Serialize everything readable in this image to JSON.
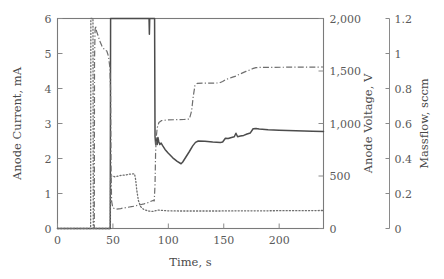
{
  "chart_data": {
    "type": "line",
    "title": "",
    "xlabel": "Time, s",
    "xlim": [
      0,
      240
    ],
    "xticks": [
      0,
      50,
      100,
      150,
      200
    ],
    "xtick_labels": [
      "0",
      "50",
      "100",
      "150",
      "200"
    ],
    "grid": false,
    "legend": "none",
    "axes": [
      {
        "id": "left",
        "label": "Anode Current, mA",
        "lim": [
          0,
          6
        ],
        "ticks": [
          0,
          1,
          2,
          3,
          4,
          5,
          6
        ],
        "tick_labels": [
          "0",
          "1",
          "2",
          "3",
          "4",
          "5",
          "6"
        ],
        "position": "left"
      },
      {
        "id": "right1",
        "label": "Anode Voltage, V",
        "lim": [
          0,
          2000
        ],
        "ticks": [
          0,
          500,
          1000,
          1500,
          2000
        ],
        "tick_labels": [
          "0",
          "500",
          "1,000",
          "1,500",
          "2,000"
        ],
        "position": "right-inner"
      },
      {
        "id": "right2",
        "label": "Massflow, sccm",
        "lim": [
          0,
          1.2
        ],
        "ticks": [
          0,
          0.2,
          0.4,
          0.6,
          0.8,
          1,
          1.2
        ],
        "tick_labels": [
          "0",
          "0.2",
          "0.4",
          "0.6",
          "0.8",
          "1",
          "1.2"
        ],
        "position": "right-outer"
      }
    ],
    "series": [
      {
        "name": "Anode Current",
        "axis": "left",
        "style": "solid",
        "color": "#4c4c4c",
        "points": [
          [
            0,
            0
          ],
          [
            47.6,
            0
          ],
          [
            47.9,
            6.0
          ],
          [
            82.6,
            6.0
          ],
          [
            82.9,
            5.55
          ],
          [
            83.2,
            6.0
          ],
          [
            87.6,
            6.0
          ],
          [
            88.0,
            2.62
          ],
          [
            88.6,
            2.4
          ],
          [
            89.3,
            2.58
          ],
          [
            90.0,
            2.4
          ],
          [
            90.6,
            2.6
          ],
          [
            91.4,
            2.48
          ],
          [
            92.3,
            2.4
          ],
          [
            93.5,
            2.44
          ],
          [
            95.0,
            2.36
          ],
          [
            97.0,
            2.26
          ],
          [
            100.0,
            2.15
          ],
          [
            104.0,
            2.02
          ],
          [
            108.0,
            1.92
          ],
          [
            111.5,
            1.85
          ],
          [
            113.0,
            1.9
          ],
          [
            116.0,
            2.05
          ],
          [
            119.0,
            2.2
          ],
          [
            122.0,
            2.36
          ],
          [
            124.5,
            2.46
          ],
          [
            127.0,
            2.5
          ],
          [
            133.0,
            2.49
          ],
          [
            140.0,
            2.47
          ],
          [
            147.0,
            2.46
          ],
          [
            149.0,
            2.47
          ],
          [
            151.5,
            2.58
          ],
          [
            154.0,
            2.57
          ],
          [
            157.0,
            2.6
          ],
          [
            159.5,
            2.62
          ],
          [
            161.0,
            2.72
          ],
          [
            162.5,
            2.62
          ],
          [
            165.0,
            2.64
          ],
          [
            168.0,
            2.66
          ],
          [
            171.0,
            2.7
          ],
          [
            174.0,
            2.73
          ],
          [
            176.5,
            2.85
          ],
          [
            179.0,
            2.86
          ],
          [
            182.0,
            2.84
          ],
          [
            190.0,
            2.82
          ],
          [
            200.0,
            2.81
          ],
          [
            215.0,
            2.79
          ],
          [
            230.0,
            2.78
          ],
          [
            240.0,
            2.77
          ]
        ]
      },
      {
        "name": "Anode Voltage",
        "axis": "right1",
        "style": "dash-dot",
        "color": "#6e6e6e",
        "points": [
          [
            0,
            0
          ],
          [
            33.2,
            0
          ],
          [
            33.4,
            1600
          ],
          [
            33.9,
            1890
          ],
          [
            34.4,
            1930
          ],
          [
            35.2,
            1880
          ],
          [
            36.5,
            1840
          ],
          [
            38.0,
            1790
          ],
          [
            40.0,
            1740
          ],
          [
            42.5,
            1700
          ],
          [
            44.5,
            1690
          ],
          [
            46.0,
            1640
          ],
          [
            47.2,
            1540
          ],
          [
            47.9,
            1330
          ],
          [
            48.3,
            600
          ],
          [
            48.8,
            260
          ],
          [
            50.0,
            195
          ],
          [
            53.0,
            185
          ],
          [
            57.0,
            190
          ],
          [
            62.0,
            200
          ],
          [
            68.0,
            210
          ],
          [
            73.0,
            222
          ],
          [
            78.0,
            234
          ],
          [
            82.0,
            248
          ],
          [
            85.0,
            262
          ],
          [
            86.5,
            268
          ],
          [
            87.3,
            262
          ],
          [
            88.0,
            420
          ],
          [
            88.5,
            720
          ],
          [
            89.2,
            880
          ],
          [
            90.0,
            960
          ],
          [
            91.5,
            1010
          ],
          [
            94.0,
            1028
          ],
          [
            99.0,
            1034
          ],
          [
            106.0,
            1036
          ],
          [
            114.0,
            1038
          ],
          [
            119.0,
            1042
          ],
          [
            121.0,
            1120
          ],
          [
            122.5,
            1260
          ],
          [
            124.0,
            1360
          ],
          [
            126.0,
            1382
          ],
          [
            132.0,
            1384
          ],
          [
            140.0,
            1385
          ],
          [
            146.0,
            1386
          ],
          [
            149.0,
            1400
          ],
          [
            152.0,
            1420
          ],
          [
            155.0,
            1430
          ],
          [
            158.0,
            1442
          ],
          [
            161.0,
            1452
          ],
          [
            164.0,
            1468
          ],
          [
            167.0,
            1482
          ],
          [
            170.0,
            1496
          ],
          [
            173.0,
            1508
          ],
          [
            176.0,
            1522
          ],
          [
            179.0,
            1532
          ],
          [
            182.0,
            1534
          ],
          [
            190.0,
            1535
          ],
          [
            205.0,
            1536
          ],
          [
            220.0,
            1537
          ],
          [
            240.0,
            1538
          ]
        ]
      },
      {
        "name": "Massflow",
        "axis": "right2",
        "style": "dotted",
        "color": "#6e6e6e",
        "points": [
          [
            0,
            0
          ],
          [
            29.9,
            0
          ],
          [
            30.1,
            1.2
          ],
          [
            31.5,
            1.2
          ],
          [
            32.0,
            1.2
          ],
          [
            32.3,
            0
          ],
          [
            33.0,
            0
          ],
          [
            40.0,
            0
          ],
          [
            47.6,
            0
          ],
          [
            47.9,
            0.3
          ],
          [
            49.5,
            0.3
          ],
          [
            52.0,
            0.295
          ],
          [
            55.0,
            0.3
          ],
          [
            58.0,
            0.305
          ],
          [
            61.0,
            0.305
          ],
          [
            64.0,
            0.31
          ],
          [
            67.0,
            0.312
          ],
          [
            69.5,
            0.312
          ],
          [
            70.5,
            0.28
          ],
          [
            71.5,
            0.22
          ],
          [
            73.0,
            0.16
          ],
          [
            75.0,
            0.125
          ],
          [
            78.0,
            0.108
          ],
          [
            82.0,
            0.1
          ],
          [
            86.0,
            0.098
          ],
          [
            88.5,
            0.102
          ],
          [
            91.0,
            0.105
          ],
          [
            95.0,
            0.103
          ],
          [
            100.0,
            0.101
          ],
          [
            110.0,
            0.1
          ],
          [
            125.0,
            0.1
          ],
          [
            145.0,
            0.1
          ],
          [
            165.0,
            0.101
          ],
          [
            185.0,
            0.101
          ],
          [
            205.0,
            0.102
          ],
          [
            225.0,
            0.102
          ],
          [
            240.0,
            0.103
          ]
        ]
      }
    ]
  }
}
